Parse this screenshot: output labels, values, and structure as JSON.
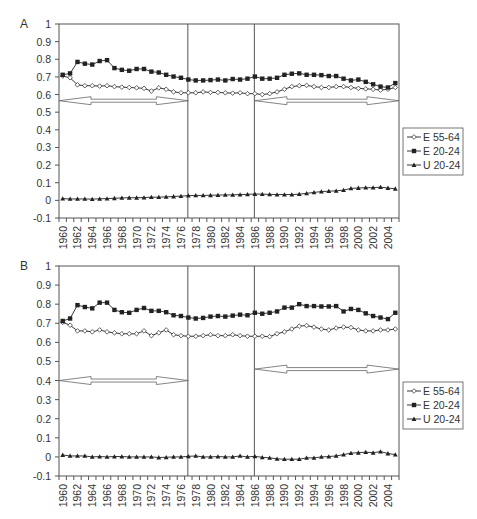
{
  "chart_data": [
    {
      "panel": "A",
      "type": "line",
      "title": "",
      "xlabel": "",
      "ylabel": "",
      "ylim": [
        -0.1,
        1
      ],
      "yticks": [
        "1",
        "0.9",
        "0.8",
        "0.7",
        "0.6",
        "0.5",
        "0.4",
        "0.3",
        "0.2",
        "0.1",
        "0",
        "-0.1"
      ],
      "x": [
        1960,
        1961,
        1962,
        1963,
        1964,
        1965,
        1966,
        1967,
        1968,
        1969,
        1970,
        1971,
        1972,
        1973,
        1974,
        1975,
        1976,
        1977,
        1978,
        1979,
        1980,
        1981,
        1982,
        1983,
        1984,
        1985,
        1986,
        1987,
        1988,
        1989,
        1990,
        1991,
        1992,
        1993,
        1994,
        1995,
        1996,
        1997,
        1998,
        1999,
        2000,
        2001,
        2002,
        2003,
        2004,
        2005
      ],
      "xtick_labels": [
        "1960",
        "1962",
        "1964",
        "1966",
        "1968",
        "1970",
        "1972",
        "1974",
        "1976",
        "1978",
        "1980",
        "1982",
        "1984",
        "1986",
        "1988",
        "1990",
        "1992",
        "1994",
        "1996",
        "1998",
        "2000",
        "2002",
        "2004"
      ],
      "grid": false,
      "legend_position": "right",
      "vertical_lines": [
        1977,
        1986
      ],
      "arrows": [
        {
          "from": 1960,
          "to": 1977,
          "y": 0.565
        },
        {
          "from": 1986,
          "to": 2005,
          "y": 0.565
        }
      ],
      "series": [
        {
          "name": "E 55-64",
          "marker": "open-diamond",
          "values": [
            0.705,
            0.695,
            0.655,
            0.65,
            0.65,
            0.648,
            0.65,
            0.645,
            0.642,
            0.64,
            0.638,
            0.635,
            0.62,
            0.638,
            0.63,
            0.615,
            0.61,
            0.61,
            0.61,
            0.615,
            0.612,
            0.612,
            0.61,
            0.608,
            0.61,
            0.605,
            0.605,
            0.6,
            0.605,
            0.615,
            0.63,
            0.645,
            0.65,
            0.652,
            0.645,
            0.64,
            0.64,
            0.645,
            0.645,
            0.64,
            0.635,
            0.632,
            0.63,
            0.625,
            0.63,
            0.64
          ]
        },
        {
          "name": "E 20-24",
          "marker": "filled-square",
          "values": [
            0.712,
            0.72,
            0.785,
            0.775,
            0.77,
            0.79,
            0.795,
            0.75,
            0.74,
            0.735,
            0.745,
            0.745,
            0.73,
            0.725,
            0.712,
            0.702,
            0.695,
            0.685,
            0.68,
            0.68,
            0.682,
            0.685,
            0.68,
            0.688,
            0.685,
            0.69,
            0.702,
            0.69,
            0.69,
            0.695,
            0.712,
            0.718,
            0.72,
            0.712,
            0.712,
            0.71,
            0.705,
            0.705,
            0.69,
            0.68,
            0.685,
            0.672,
            0.658,
            0.645,
            0.64,
            0.665
          ]
        },
        {
          "name": "U 20-24",
          "marker": "filled-triangle",
          "values": [
            0.01,
            0.008,
            0.008,
            0.008,
            0.007,
            0.009,
            0.01,
            0.012,
            0.014,
            0.015,
            0.015,
            0.016,
            0.018,
            0.018,
            0.02,
            0.022,
            0.024,
            0.027,
            0.028,
            0.028,
            0.029,
            0.03,
            0.031,
            0.031,
            0.033,
            0.034,
            0.036,
            0.035,
            0.034,
            0.033,
            0.033,
            0.033,
            0.035,
            0.04,
            0.045,
            0.05,
            0.052,
            0.054,
            0.058,
            0.068,
            0.07,
            0.072,
            0.072,
            0.075,
            0.07,
            0.066
          ]
        }
      ]
    },
    {
      "panel": "B",
      "type": "line",
      "title": "",
      "xlabel": "",
      "ylabel": "",
      "ylim": [
        -0.1,
        1
      ],
      "yticks": [
        "1",
        "0.9",
        "0.8",
        "0.7",
        "0.6",
        "0.5",
        "0.4",
        "0.3",
        "0.2",
        "0.1",
        "0",
        "-0.1"
      ],
      "x": [
        1960,
        1961,
        1962,
        1963,
        1964,
        1965,
        1966,
        1967,
        1968,
        1969,
        1970,
        1971,
        1972,
        1973,
        1974,
        1975,
        1976,
        1977,
        1978,
        1979,
        1980,
        1981,
        1982,
        1983,
        1984,
        1985,
        1986,
        1987,
        1988,
        1989,
        1990,
        1991,
        1992,
        1993,
        1994,
        1995,
        1996,
        1997,
        1998,
        1999,
        2000,
        2001,
        2002,
        2003,
        2004,
        2005
      ],
      "xtick_labels": [
        "1960",
        "1962",
        "1964",
        "1966",
        "1968",
        "1970",
        "1972",
        "1974",
        "1976",
        "1978",
        "1980",
        "1982",
        "1984",
        "1986",
        "1988",
        "1990",
        "1992",
        "1994",
        "1996",
        "1998",
        "2000",
        "2002",
        "2004"
      ],
      "grid": false,
      "legend_position": "right",
      "vertical_lines": [
        1977,
        1986
      ],
      "arrows": [
        {
          "from": 1960,
          "to": 1977,
          "y": 0.4
        },
        {
          "from": 1986,
          "to": 2005,
          "y": 0.46
        }
      ],
      "series": [
        {
          "name": "E 55-64",
          "marker": "open-diamond",
          "values": [
            0.705,
            0.69,
            0.66,
            0.66,
            0.655,
            0.665,
            0.655,
            0.65,
            0.645,
            0.645,
            0.645,
            0.66,
            0.635,
            0.65,
            0.665,
            0.64,
            0.635,
            0.632,
            0.632,
            0.635,
            0.64,
            0.635,
            0.635,
            0.64,
            0.635,
            0.632,
            0.632,
            0.632,
            0.63,
            0.645,
            0.655,
            0.67,
            0.685,
            0.688,
            0.68,
            0.67,
            0.665,
            0.675,
            0.68,
            0.678,
            0.665,
            0.66,
            0.66,
            0.665,
            0.665,
            0.67
          ]
        },
        {
          "name": "E 20-24",
          "marker": "filled-square",
          "values": [
            0.712,
            0.725,
            0.795,
            0.785,
            0.778,
            0.808,
            0.808,
            0.77,
            0.758,
            0.755,
            0.77,
            0.78,
            0.765,
            0.765,
            0.758,
            0.742,
            0.738,
            0.73,
            0.725,
            0.728,
            0.735,
            0.738,
            0.735,
            0.74,
            0.745,
            0.742,
            0.755,
            0.75,
            0.755,
            0.762,
            0.782,
            0.782,
            0.8,
            0.79,
            0.79,
            0.788,
            0.788,
            0.79,
            0.762,
            0.775,
            0.77,
            0.752,
            0.738,
            0.73,
            0.722,
            0.755
          ]
        },
        {
          "name": "U 20-24",
          "marker": "filled-triangle",
          "values": [
            0.01,
            0.005,
            0.005,
            0.005,
            0.0,
            0.002,
            0.0,
            0.002,
            0.002,
            0.0,
            0.0,
            0.0,
            0.0,
            -0.003,
            -0.002,
            0.0,
            0.0,
            0.003,
            0.005,
            0.0,
            0.0,
            0.002,
            0.0,
            0.0,
            0.005,
            0.0,
            0.003,
            -0.002,
            -0.005,
            -0.01,
            -0.012,
            -0.012,
            -0.012,
            -0.005,
            -0.005,
            0.0,
            0.002,
            0.005,
            0.012,
            0.02,
            0.022,
            0.025,
            0.022,
            0.028,
            0.018,
            0.012
          ]
        }
      ]
    }
  ],
  "panels": [
    {
      "label": "A"
    },
    {
      "label": "B"
    }
  ],
  "legend": {
    "items": [
      {
        "label": "E 55-64",
        "icon": "open-diamond-line"
      },
      {
        "label": "E 20-24",
        "icon": "filled-square-line"
      },
      {
        "label": "U 20-24",
        "icon": "filled-triangle-line"
      }
    ]
  },
  "colors": {
    "line": "#222222",
    "axis": "#555555",
    "arrow_stroke": "#666666",
    "background": "#ffffff"
  }
}
